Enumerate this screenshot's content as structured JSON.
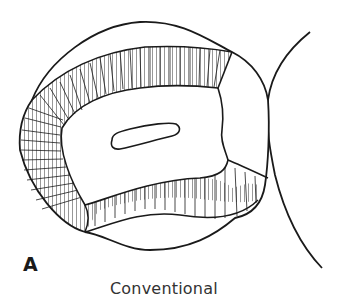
{
  "figure": {
    "panel_label": "A",
    "caption": "Conventional",
    "colors": {
      "line": "#1a1a1a",
      "background": "#ffffff"
    }
  }
}
